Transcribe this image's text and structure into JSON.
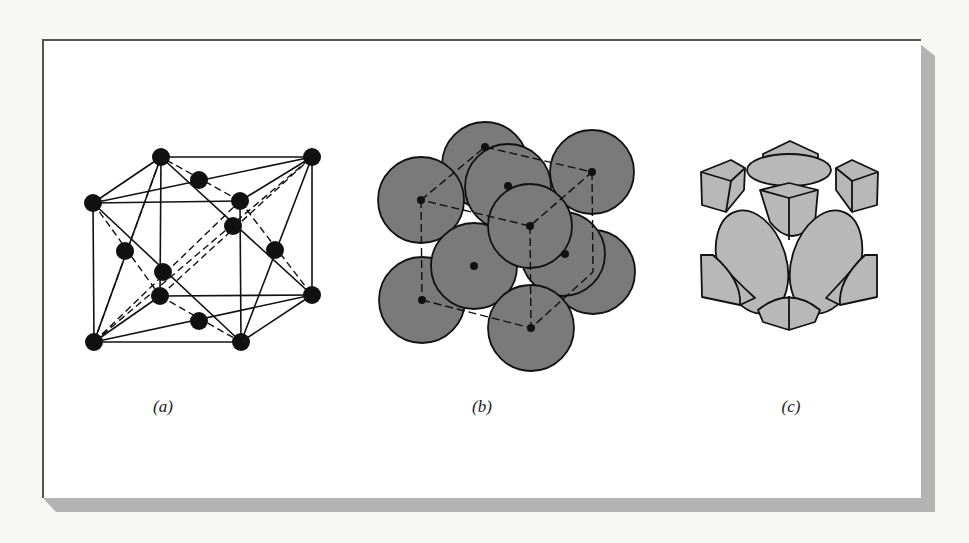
{
  "figure": {
    "panels": [
      {
        "id": "a",
        "label": "(a)",
        "description": "face-centered cubic unit cell, ball-and-stick with dashed lines"
      },
      {
        "id": "b",
        "label": "(b)",
        "description": "hard-sphere model of FCC cell"
      },
      {
        "id": "c",
        "label": "(c)",
        "description": "reduced-sphere sections inside unit cell"
      }
    ]
  },
  "colors": {
    "frame_border": "#555555",
    "shadow": "#b3b3b3",
    "atom": "#111111",
    "sphere_fill_b": "#7a7a7a",
    "sphere_fill_c": "#b8b8b8"
  }
}
